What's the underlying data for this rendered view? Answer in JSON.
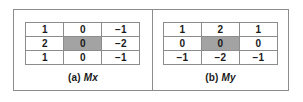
{
  "figure": {
    "border_color": "#8c8c8c",
    "highlight_color": "#a3a3a3",
    "text_color": "#1a1a1a",
    "panels": [
      {
        "id": "mx",
        "caption_index": "(a)",
        "caption_symbol": "Mx",
        "matrix": {
          "rows": 3,
          "cols": 3,
          "values": [
            [
              "1",
              "0",
              "−1"
            ],
            [
              "2",
              "0",
              "−2"
            ],
            [
              "1",
              "0",
              "−1"
            ]
          ],
          "highlight_cell": [
            1,
            1
          ]
        }
      },
      {
        "id": "my",
        "caption_index": "(b)",
        "caption_symbol": "My",
        "matrix": {
          "rows": 3,
          "cols": 3,
          "values": [
            [
              "1",
              "2",
              "1"
            ],
            [
              "0",
              "0",
              "0"
            ],
            [
              "−1",
              "−2",
              "−1"
            ]
          ],
          "highlight_cell": [
            1,
            1
          ]
        }
      }
    ]
  }
}
